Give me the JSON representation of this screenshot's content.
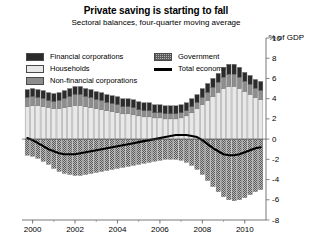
{
  "header": {
    "title": "Private saving is starting to fall",
    "subtitle": "Sectoral balances, four-quarter moving average",
    "unit": "% of GDP"
  },
  "legend": {
    "items": [
      {
        "label": "Financial corporations",
        "key": "financial",
        "swatch": "solid",
        "color": "#2b2b2b"
      },
      {
        "label": "Households",
        "key": "households",
        "swatch": "solid",
        "color": "#e8e8e8"
      },
      {
        "label": "Non-financial corporations",
        "key": "nonfinancial",
        "swatch": "solid",
        "color": "#8d8d8d"
      },
      {
        "label": "Government",
        "key": "government",
        "swatch": "hatch",
        "color": "#b4b4b4"
      },
      {
        "label": "Total economy",
        "key": "total",
        "swatch": "line",
        "color": "#000000"
      }
    ]
  },
  "chart_data": {
    "type": "bar",
    "stacked": true,
    "title": "Private saving is starting to fall",
    "subtitle": "Sectoral balances, four-quarter moving average",
    "xlabel": "",
    "ylabel": "% of GDP",
    "ylim": [
      -8,
      10
    ],
    "yticks": [
      10,
      8,
      6,
      4,
      2,
      0,
      -2,
      -4,
      -6,
      -8
    ],
    "xlim": [
      1999.5,
      2011.0
    ],
    "xticks": [
      2000,
      2002,
      2004,
      2006,
      2008,
      2010
    ],
    "xticklabels": [
      "2000",
      "2002",
      "2004",
      "2006",
      "2008",
      "2010"
    ],
    "xminorticks": [
      2001,
      2003,
      2005,
      2007,
      2009
    ],
    "grid": false,
    "legend_position": "top",
    "x": [
      1999.75,
      2000.0,
      2000.25,
      2000.5,
      2000.75,
      2001.0,
      2001.25,
      2001.5,
      2001.75,
      2002.0,
      2002.25,
      2002.5,
      2002.75,
      2003.0,
      2003.25,
      2003.5,
      2003.75,
      2004.0,
      2004.25,
      2004.5,
      2004.75,
      2005.0,
      2005.25,
      2005.5,
      2005.75,
      2006.0,
      2006.25,
      2006.5,
      2006.75,
      2007.0,
      2007.25,
      2007.5,
      2007.75,
      2008.0,
      2008.25,
      2008.5,
      2008.75,
      2009.0,
      2009.25,
      2009.5,
      2009.75,
      2010.0,
      2010.25,
      2010.5,
      2010.75
    ],
    "series": [
      {
        "name": "Households",
        "key": "households",
        "color": "#e8e8e8",
        "pattern": "solid",
        "values": [
          3.2,
          3.3,
          3.3,
          3.2,
          3.1,
          3.0,
          3.0,
          3.1,
          3.2,
          3.3,
          3.3,
          3.2,
          3.1,
          3.0,
          2.9,
          2.8,
          2.7,
          2.6,
          2.5,
          2.5,
          2.4,
          2.3,
          2.2,
          2.2,
          2.1,
          2.1,
          2.0,
          2.0,
          2.0,
          2.1,
          2.3,
          2.6,
          3.0,
          3.4,
          3.8,
          4.2,
          4.6,
          5.0,
          5.2,
          5.2,
          5.0,
          4.7,
          4.4,
          4.1,
          3.9
        ]
      },
      {
        "name": "Non-financial corporations",
        "key": "nonfinancial",
        "color": "#8d8d8d",
        "pattern": "solid",
        "values": [
          0.9,
          0.9,
          0.8,
          0.8,
          0.7,
          0.7,
          0.8,
          0.9,
          1.0,
          1.1,
          1.1,
          1.0,
          1.0,
          0.9,
          0.9,
          0.8,
          0.8,
          0.8,
          0.7,
          0.7,
          0.7,
          0.6,
          0.6,
          0.6,
          0.5,
          0.5,
          0.5,
          0.5,
          0.5,
          0.5,
          0.5,
          0.6,
          0.6,
          0.7,
          0.8,
          0.9,
          1.0,
          1.1,
          1.2,
          1.2,
          1.1,
          1.0,
          1.0,
          0.9,
          0.9
        ]
      },
      {
        "name": "Financial corporations",
        "key": "financial",
        "color": "#2b2b2b",
        "pattern": "solid",
        "values": [
          0.8,
          0.8,
          0.8,
          0.8,
          0.8,
          0.8,
          0.8,
          0.8,
          0.8,
          0.8,
          0.8,
          0.8,
          0.8,
          0.8,
          0.8,
          0.8,
          0.8,
          0.8,
          0.8,
          0.8,
          0.8,
          0.8,
          0.8,
          0.8,
          0.8,
          0.8,
          0.8,
          0.8,
          0.8,
          0.8,
          0.8,
          0.8,
          0.8,
          0.9,
          0.9,
          0.9,
          0.9,
          1.0,
          1.0,
          1.0,
          1.0,
          0.9,
          0.9,
          0.9,
          0.9
        ]
      },
      {
        "name": "Government",
        "key": "government",
        "color": "#b4b4b4",
        "pattern": "hatch",
        "values": [
          -1.6,
          -1.7,
          -1.9,
          -2.2,
          -2.5,
          -2.9,
          -3.2,
          -3.4,
          -3.5,
          -3.6,
          -3.6,
          -3.5,
          -3.4,
          -3.3,
          -3.2,
          -3.1,
          -3.0,
          -2.9,
          -2.8,
          -2.7,
          -2.6,
          -2.5,
          -2.4,
          -2.3,
          -2.2,
          -2.1,
          -2.0,
          -2.0,
          -2.0,
          -2.1,
          -2.3,
          -2.6,
          -3.0,
          -3.5,
          -4.1,
          -4.7,
          -5.2,
          -5.7,
          -6.0,
          -6.1,
          -6.0,
          -5.8,
          -5.5,
          -5.2,
          -5.0
        ]
      }
    ],
    "line_series": {
      "name": "Total economy",
      "key": "total",
      "color": "#000000",
      "values": [
        0.1,
        -0.1,
        -0.4,
        -0.7,
        -1.0,
        -1.2,
        -1.4,
        -1.5,
        -1.5,
        -1.5,
        -1.4,
        -1.3,
        -1.2,
        -1.1,
        -1.0,
        -0.9,
        -0.8,
        -0.7,
        -0.6,
        -0.5,
        -0.4,
        -0.3,
        -0.2,
        -0.1,
        0.0,
        0.1,
        0.2,
        0.3,
        0.4,
        0.4,
        0.4,
        0.3,
        0.2,
        -0.1,
        -0.5,
        -0.9,
        -1.2,
        -1.5,
        -1.6,
        -1.6,
        -1.5,
        -1.3,
        -1.1,
        -0.9,
        -0.8
      ]
    }
  }
}
